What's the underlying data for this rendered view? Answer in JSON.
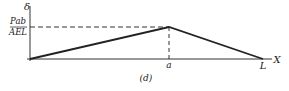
{
  "diagram": {
    "y_axis_label": "δ",
    "x_axis_label": "X",
    "y_value_label_numerator": "Pab",
    "y_value_label_denominator": "AEL",
    "x_tick_peak": "a",
    "x_tick_end": "L",
    "caption": "(d)",
    "line_color": "#222222",
    "points": [
      {
        "x": "0",
        "y": "0"
      },
      {
        "x": "a",
        "y": "Pab/AEL"
      },
      {
        "x": "L",
        "y": "0"
      }
    ]
  }
}
